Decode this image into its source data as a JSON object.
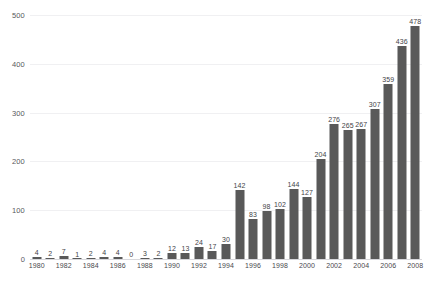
{
  "chart_data": {
    "type": "bar",
    "title": "",
    "subtitle": "",
    "xlabel": "",
    "ylabel": "",
    "grid": true,
    "legend": false,
    "legend_position": "none",
    "bar_color": "#595959",
    "gridline_color": "#f0f0f2",
    "axis_color": "#d8d8dc",
    "value_label_color": "#444448",
    "tick_label_color": "#4a4a4e",
    "ylim": [
      0,
      500
    ],
    "yticks": [
      0,
      100,
      200,
      300,
      400,
      500
    ],
    "ytick_labels": [
      "0",
      "100",
      "200",
      "300",
      "400",
      "500"
    ],
    "xtick_labels_shown": [
      "1980",
      "1982",
      "1984",
      "1986",
      "1988",
      "1990",
      "1992",
      "1994",
      "1996",
      "1998",
      "2000",
      "2002",
      "2004",
      "2006",
      "2008"
    ],
    "categories": [
      "1980",
      "1981",
      "1982",
      "1983",
      "1984",
      "1985",
      "1986",
      "1987",
      "1988",
      "1989",
      "1990",
      "1991",
      "1992",
      "1993",
      "1994",
      "1995",
      "1996",
      "1997",
      "1998",
      "1999",
      "2000",
      "2001",
      "2002",
      "2003",
      "2004",
      "2005",
      "2006",
      "2007",
      "2008"
    ],
    "values": [
      4,
      2,
      7,
      1,
      2,
      4,
      4,
      0,
      3,
      2,
      12,
      13,
      24,
      17,
      30,
      142,
      83,
      98,
      102,
      144,
      127,
      204,
      276,
      265,
      267,
      307,
      359,
      436,
      478
    ],
    "value_labels": [
      "4",
      "2",
      "7",
      "1",
      "2",
      "4",
      "4",
      "0",
      "3",
      "2",
      "12",
      "13",
      "24",
      "17",
      "30",
      "142",
      "83",
      "98",
      "102",
      "144",
      "127",
      "204",
      "276",
      "265",
      "267",
      "307",
      "359",
      "436",
      "478"
    ],
    "show_value_labels": true
  }
}
